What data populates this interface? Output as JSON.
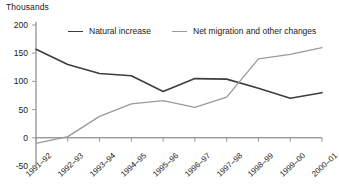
{
  "chart_data": {
    "type": "line",
    "title": "",
    "ylabel": "Thousands",
    "xlabel": "",
    "ylim": [
      -50,
      200
    ],
    "yticks": [
      200,
      150,
      100,
      50,
      0,
      -50
    ],
    "grid": false,
    "legend_position": "top",
    "categories": [
      "1991–92",
      "1992–93",
      "1993–94",
      "1994–95",
      "1995–96",
      "1996–97",
      "1997–98",
      "1998–99",
      "1999–00",
      "2000–01"
    ],
    "series": [
      {
        "name": "Natural increase",
        "color": "#3d3d3d",
        "values": [
          157,
          130,
          114,
          110,
          82,
          105,
          104,
          88,
          70,
          80
        ]
      },
      {
        "name": "Net migration and other changes",
        "color": "#9a9a9a",
        "values": [
          -10,
          2,
          38,
          60,
          66,
          54,
          72,
          140,
          148,
          160
        ]
      }
    ]
  },
  "legend": {
    "items": [
      {
        "label": "Natural increase",
        "color": "#3d3d3d"
      },
      {
        "label": "Net migration and other changes",
        "color": "#9a9a9a"
      }
    ]
  },
  "axis": {
    "y_title": "Thousands",
    "y_labels": [
      "200",
      "150",
      "100",
      "50",
      "0",
      "-50"
    ],
    "x_labels": [
      "1991–92",
      "1992–93",
      "1993–94",
      "1994–95",
      "1995–96",
      "1996–97",
      "1997–98",
      "1998–99",
      "1999–00",
      "2000–01"
    ],
    "axis_color": "#9a9a9a",
    "zero_line_color": "#6e6e6e"
  }
}
